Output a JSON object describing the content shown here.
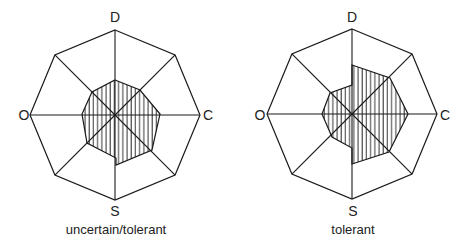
{
  "axes": [
    "D",
    "C",
    "S",
    "O"
  ],
  "colors": {
    "line": "#1a1a1a",
    "background": "#ffffff",
    "hatch": "#1a1a1a"
  },
  "charts": [
    {
      "caption": "uncertain/tolerant",
      "center": [
        115,
        115
      ],
      "outer_radius": 85,
      "profile": [
        [
          115,
          80
        ],
        [
          140,
          90
        ],
        [
          160,
          114
        ],
        [
          152,
          150
        ],
        [
          116,
          165
        ],
        [
          116,
          158
        ],
        [
          87,
          143
        ],
        [
          82,
          114
        ],
        [
          92,
          92
        ],
        [
          115,
          80
        ]
      ]
    },
    {
      "caption": "tolerant",
      "center": [
        352,
        114
      ],
      "outer_radius": 85,
      "profile": [
        [
          352,
          65
        ],
        [
          390,
          78
        ],
        [
          408,
          114
        ],
        [
          389,
          152
        ],
        [
          352,
          164
        ],
        [
          352,
          148
        ],
        [
          332,
          137
        ],
        [
          322,
          114
        ],
        [
          330,
          93
        ],
        [
          352,
          85
        ],
        [
          352,
          65
        ]
      ]
    }
  ],
  "chart_data": [
    {
      "type": "radar",
      "title": "uncertain/tolerant",
      "axes_labeled": [
        "D",
        "C",
        "S",
        "O"
      ],
      "spokes": 8,
      "note": "Hatched profile polygon within octagonal frame; approximate relative radii (0-1) starting at D going clockwise",
      "values": [
        0.41,
        0.38,
        0.53,
        0.48,
        0.59,
        0.4,
        0.39,
        0.37
      ]
    },
    {
      "type": "radar",
      "title": "tolerant",
      "axes_labeled": [
        "D",
        "C",
        "S",
        "O"
      ],
      "spokes": 8,
      "note": "Hatched profile polygon within octagonal frame; approximate relative radii (0-1) starting at D going clockwise",
      "values": [
        0.58,
        0.62,
        0.66,
        0.62,
        0.59,
        0.28,
        0.35,
        0.36
      ]
    }
  ]
}
